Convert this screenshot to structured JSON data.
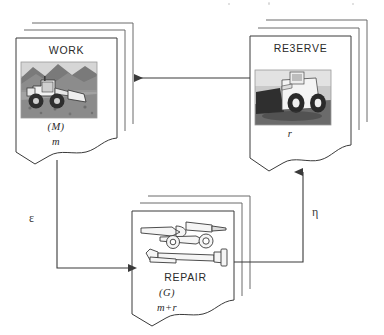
{
  "diagram": {
    "background_color": "#ffffff",
    "line_color": "#3a3a3a",
    "text_color": "#2a2a2a"
  },
  "nodes": [
    {
      "id": "work",
      "title": "WORK",
      "symbol": "(M)",
      "variable": "m",
      "icon": "wheel-loader-photo",
      "stack_count": 3
    },
    {
      "id": "reserve",
      "title": "RE3ERVE",
      "symbol": "",
      "variable": "r",
      "icon": "wheel-loader-front-photo",
      "stack_count": 3
    },
    {
      "id": "repair",
      "title": "REPAIR",
      "symbol": "(G)",
      "variable": "m+r",
      "icon": "wrench-tools-clipart",
      "stack_count": 3
    }
  ],
  "edges": [
    {
      "id": "reserve-to-work",
      "from": "reserve",
      "to": "work",
      "label": "",
      "direction": "left"
    },
    {
      "id": "work-to-repair",
      "from": "work",
      "to": "repair",
      "label": "ε",
      "direction": "down-right"
    },
    {
      "id": "repair-to-reserve",
      "from": "repair",
      "to": "reserve",
      "label": "η",
      "direction": "right-up"
    }
  ]
}
